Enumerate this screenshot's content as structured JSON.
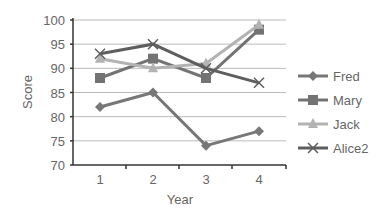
{
  "chart_data": {
    "type": "line",
    "title": "",
    "xlabel": "Year",
    "ylabel": "Score",
    "x": [
      1,
      2,
      3,
      4
    ],
    "ylim": [
      70,
      100
    ],
    "yticks": [
      70,
      75,
      80,
      85,
      90,
      95,
      100
    ],
    "grid": true,
    "legend_position": "right",
    "series": [
      {
        "name": "Fred",
        "values": [
          82,
          85,
          74,
          77
        ],
        "marker": "diamond",
        "color": "#777777"
      },
      {
        "name": "Mary",
        "values": [
          88,
          92,
          88,
          98
        ],
        "marker": "square",
        "color": "#737373"
      },
      {
        "name": "Jack",
        "values": [
          92,
          90,
          91,
          99
        ],
        "marker": "triangle",
        "color": "#b3b3b3"
      },
      {
        "name": "Alice2",
        "values": [
          93,
          95,
          90,
          87
        ],
        "marker": "x",
        "color": "#5e5e5e"
      }
    ]
  }
}
